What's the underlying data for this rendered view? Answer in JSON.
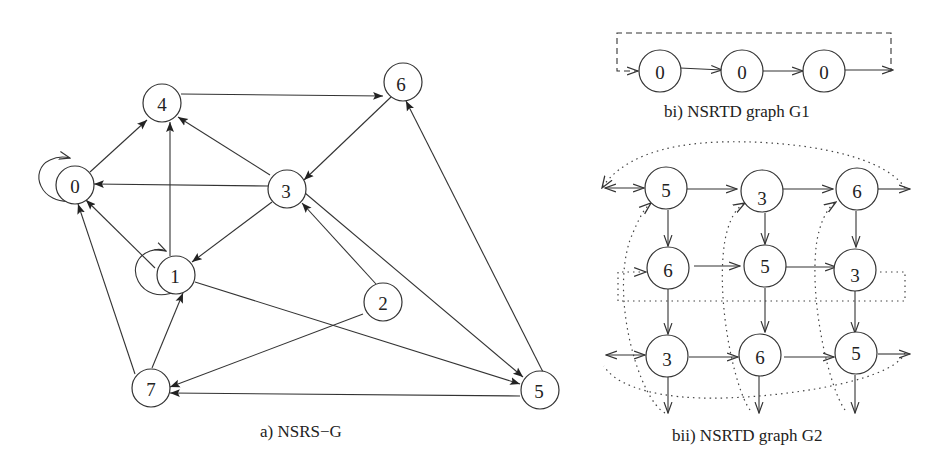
{
  "figure": {
    "panel_a": {
      "caption": "a) NSRS−G",
      "nodes": [
        {
          "id": "0",
          "label": "0",
          "x": 75,
          "y": 185
        },
        {
          "id": "4",
          "label": "4",
          "x": 162,
          "y": 103
        },
        {
          "id": "6",
          "label": "6",
          "x": 403,
          "y": 82
        },
        {
          "id": "3",
          "label": "3",
          "x": 287,
          "y": 189
        },
        {
          "id": "1",
          "label": "1",
          "x": 175,
          "y": 275
        },
        {
          "id": "2",
          "label": "2",
          "x": 383,
          "y": 302
        },
        {
          "id": "7",
          "label": "7",
          "x": 151,
          "y": 388
        },
        {
          "id": "5",
          "label": "5",
          "x": 540,
          "y": 390
        }
      ],
      "edges": [
        {
          "from": "0",
          "to": "0",
          "type": "self-loop"
        },
        {
          "from": "0",
          "to": "4"
        },
        {
          "from": "4",
          "to": "6"
        },
        {
          "from": "3",
          "to": "4"
        },
        {
          "from": "3",
          "to": "0"
        },
        {
          "from": "6",
          "to": "3"
        },
        {
          "from": "3",
          "to": "1"
        },
        {
          "from": "3",
          "to": "5"
        },
        {
          "from": "2",
          "to": "3"
        },
        {
          "from": "1",
          "to": "0"
        },
        {
          "from": "1",
          "to": "4"
        },
        {
          "from": "1",
          "to": "1",
          "type": "self-loop"
        },
        {
          "from": "1",
          "to": "5"
        },
        {
          "from": "2",
          "to": "7"
        },
        {
          "from": "7",
          "to": "1"
        },
        {
          "from": "7",
          "to": "0"
        },
        {
          "from": "5",
          "to": "7"
        },
        {
          "from": "5",
          "to": "6"
        }
      ]
    },
    "panel_bi": {
      "caption": "bi) NSRTD graph G1",
      "nodes": [
        {
          "label": "0",
          "x": 660,
          "y": 75
        },
        {
          "label": "0",
          "x": 742,
          "y": 75
        },
        {
          "label": "0",
          "x": 824,
          "y": 75
        }
      ],
      "feedback": "dashed wrap-around edge from last output back to first input"
    },
    "panel_bii": {
      "caption": "bii) NSRTD graph G2",
      "grid": [
        [
          "5",
          "3",
          "6"
        ],
        [
          "6",
          "5",
          "3"
        ],
        [
          "3",
          "6",
          "5"
        ]
      ],
      "col_x": [
        667,
        762,
        857
      ],
      "row_y": [
        188,
        270,
        355
      ],
      "feedback": "dotted wrap-around edges (toroidal mesh)"
    }
  }
}
